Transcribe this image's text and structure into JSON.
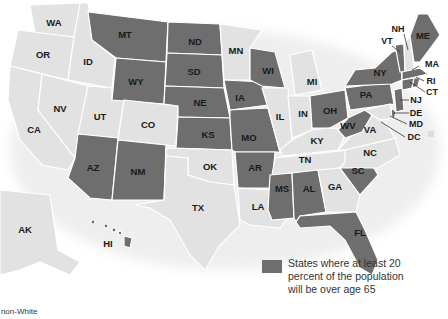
{
  "colors": {
    "highlight": "#6e6e6e",
    "other": "#e2e2e2",
    "border": "#ffffff",
    "background": "#ffffff"
  },
  "legend": {
    "swatch_color": "#6e6e6e",
    "label": "States where at least 20 percent of the population will be over age 65"
  },
  "footnote": "r non-White",
  "states": {
    "WA": {
      "label": "WA",
      "highlighted": false
    },
    "OR": {
      "label": "OR",
      "highlighted": false
    },
    "CA": {
      "label": "CA",
      "highlighted": false
    },
    "ID": {
      "label": "ID",
      "highlighted": false
    },
    "NV": {
      "label": "NV",
      "highlighted": false
    },
    "UT": {
      "label": "UT",
      "highlighted": false
    },
    "AZ": {
      "label": "AZ",
      "highlighted": true
    },
    "MT": {
      "label": "MT",
      "highlighted": true
    },
    "WY": {
      "label": "WY",
      "highlighted": true
    },
    "CO": {
      "label": "CO",
      "highlighted": false
    },
    "NM": {
      "label": "NM",
      "highlighted": true
    },
    "ND": {
      "label": "ND",
      "highlighted": true
    },
    "SD": {
      "label": "SD",
      "highlighted": true
    },
    "NE": {
      "label": "NE",
      "highlighted": true
    },
    "KS": {
      "label": "KS",
      "highlighted": true
    },
    "OK": {
      "label": "OK",
      "highlighted": false
    },
    "TX": {
      "label": "TX",
      "highlighted": false
    },
    "MN": {
      "label": "MN",
      "highlighted": false
    },
    "IA": {
      "label": "IA",
      "highlighted": true
    },
    "MO": {
      "label": "MO",
      "highlighted": true
    },
    "AR": {
      "label": "AR",
      "highlighted": true
    },
    "LA": {
      "label": "LA",
      "highlighted": false
    },
    "WI": {
      "label": "WI",
      "highlighted": true
    },
    "IL": {
      "label": "IL",
      "highlighted": false
    },
    "MI": {
      "label": "MI",
      "highlighted": false
    },
    "IN": {
      "label": "IN",
      "highlighted": false
    },
    "OH": {
      "label": "OH",
      "highlighted": true
    },
    "KY": {
      "label": "KY",
      "highlighted": false
    },
    "TN": {
      "label": "TN",
      "highlighted": false
    },
    "MS": {
      "label": "MS",
      "highlighted": true
    },
    "AL": {
      "label": "AL",
      "highlighted": true
    },
    "GA": {
      "label": "GA",
      "highlighted": false
    },
    "FL": {
      "label": "FL",
      "highlighted": true
    },
    "SC": {
      "label": "SC",
      "highlighted": true
    },
    "NC": {
      "label": "NC",
      "highlighted": false
    },
    "VA": {
      "label": "VA",
      "highlighted": false
    },
    "WV": {
      "label": "WV",
      "highlighted": true
    },
    "PA": {
      "label": "PA",
      "highlighted": true
    },
    "NY": {
      "label": "NY",
      "highlighted": true
    },
    "VT": {
      "label": "VT",
      "highlighted": true
    },
    "NH": {
      "label": "NH",
      "highlighted": false
    },
    "ME": {
      "label": "ME",
      "highlighted": true
    },
    "MA": {
      "label": "MA",
      "highlighted": true
    },
    "RI": {
      "label": "RI",
      "highlighted": true
    },
    "CT": {
      "label": "CT",
      "highlighted": true
    },
    "NJ": {
      "label": "NJ",
      "highlighted": true
    },
    "DE": {
      "label": "DE",
      "highlighted": true
    },
    "MD": {
      "label": "MD",
      "highlighted": false
    },
    "DC": {
      "label": "DC",
      "highlighted": false
    },
    "AK": {
      "label": "AK",
      "highlighted": false
    },
    "HI": {
      "label": "HI",
      "highlighted": true
    }
  }
}
